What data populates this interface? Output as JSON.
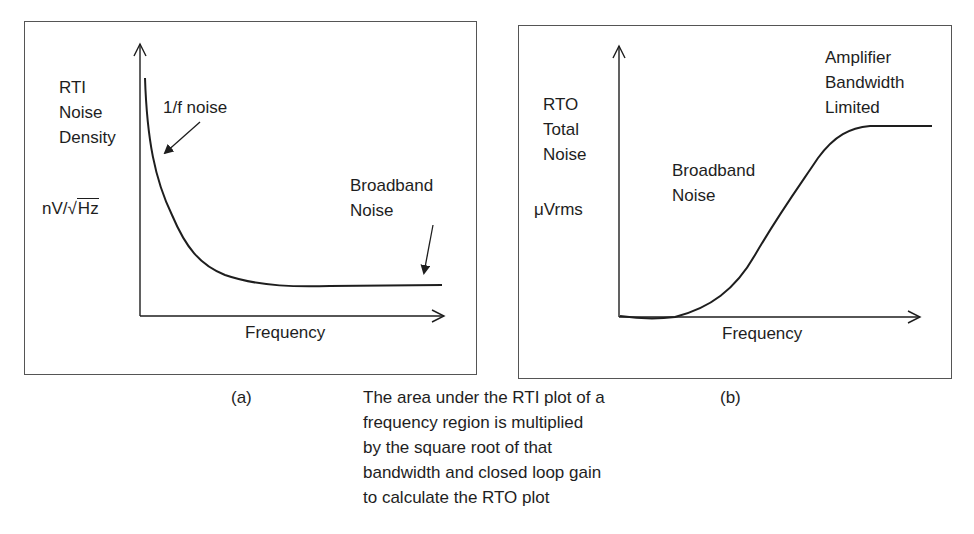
{
  "figure": {
    "panel_a": {
      "label": "(a)",
      "y_axis_label_lines": [
        "RTI",
        "Noise",
        "Density"
      ],
      "y_unit_prefix": "nV/√",
      "y_unit_radicand": "Hz",
      "x_axis_label": "Frequency",
      "annotation_1f": "1/f noise",
      "annotation_broadband_lines": [
        "Broadband",
        "Noise"
      ]
    },
    "panel_b": {
      "label": "(b)",
      "y_axis_label_lines": [
        "RTO",
        "Total",
        "Noise"
      ],
      "y_unit": "μVrms",
      "x_axis_label": "Frequency",
      "annotation_broadband_lines": [
        "Broadband",
        "Noise"
      ],
      "annotation_limit_lines": [
        "Amplifier",
        "Bandwidth",
        "Limited"
      ]
    },
    "caption_lines": [
      "The area under the RTI plot of a",
      "frequency region is multiplied",
      "by the square root of that",
      "bandwidth and closed loop gain",
      "to calculate the RTO plot"
    ],
    "colors": {
      "line": "#1e1e1e",
      "frame": "#555555",
      "background": "#ffffff"
    }
  }
}
